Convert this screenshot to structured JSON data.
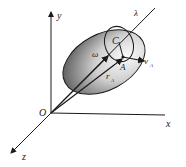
{
  "diagram": {
    "labels": {
      "y": "y",
      "x": "x",
      "z": "z",
      "origin": "O",
      "lambda": "λ",
      "center": "C",
      "omega": "ω",
      "point": "A",
      "r_sub": "r",
      "r_idx": "A",
      "v_sub": "v",
      "v_idx": "A"
    },
    "colors": {
      "stroke": "#1a1a1a",
      "shade_dark": "#555555",
      "shade_light": "#f5f5f5"
    }
  }
}
